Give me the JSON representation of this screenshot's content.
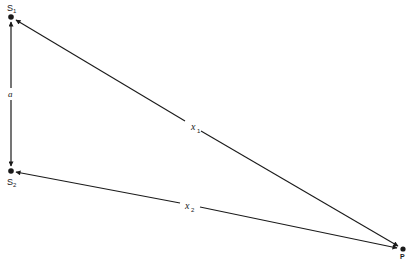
{
  "diagram": {
    "points": {
      "s1": {
        "label": "S",
        "sub": "1"
      },
      "s2": {
        "label": "S",
        "sub": "2"
      },
      "p": {
        "label": "P"
      }
    },
    "edges": {
      "a": {
        "label": "a"
      },
      "x1": {
        "label": "x",
        "sub": "1"
      },
      "x2": {
        "label": "x",
        "sub": "2"
      }
    },
    "colors": {
      "ink": "#1a1a1a",
      "background": "#ffffff"
    }
  }
}
